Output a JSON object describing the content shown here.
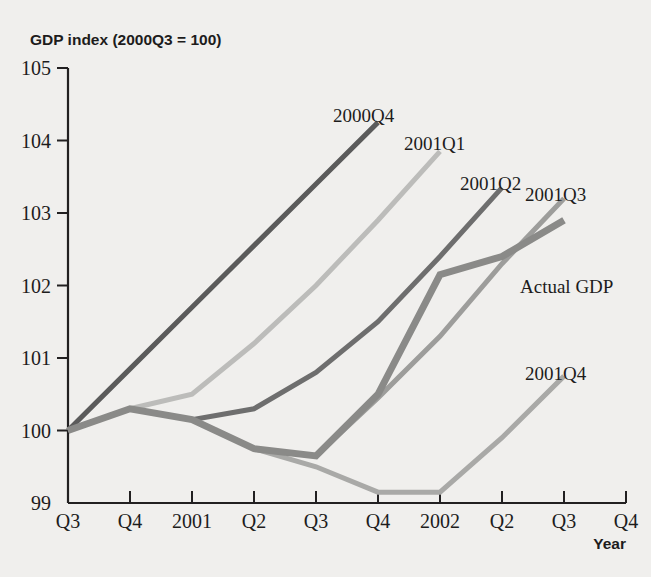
{
  "chart_data": {
    "type": "line",
    "title": "GDP index (2000Q3 = 100)",
    "ylabel": "GDP index (2000Q3 = 100)",
    "xlabel": "Year",
    "ylim": [
      99,
      105
    ],
    "ytick_labels": [
      "105",
      "104",
      "103",
      "102",
      "101",
      "100",
      "99"
    ],
    "ytick_values": [
      105,
      104,
      103,
      102,
      101,
      100,
      99
    ],
    "xtick_labels": [
      "Q3",
      "Q4",
      "2001",
      "Q2",
      "Q3",
      "Q4",
      "2002",
      "Q2",
      "Q3",
      "Q4"
    ],
    "x_index": [
      0,
      1,
      2,
      3,
      4,
      5,
      6,
      7,
      8,
      9
    ],
    "grid": false,
    "legend": "inline-labels",
    "series": [
      {
        "name": "2000Q4",
        "label": "2000Q4",
        "color": "#5b5b5b",
        "width": 5.0,
        "x": [
          0,
          1,
          2,
          3,
          4,
          5
        ],
        "values": [
          100.0,
          100.85,
          101.7,
          102.55,
          103.4,
          104.25
        ]
      },
      {
        "name": "2001Q1",
        "label": "2001Q1",
        "color": "#bcbcba",
        "width": 5.0,
        "x": [
          0,
          1,
          2,
          3,
          4,
          5,
          6
        ],
        "values": [
          100.0,
          100.3,
          100.5,
          101.2,
          102.0,
          102.9,
          103.85
        ]
      },
      {
        "name": "2001Q2",
        "label": "2001Q2",
        "color": "#6e6e6e",
        "width": 5.0,
        "x": [
          1,
          2,
          3,
          4,
          5,
          6,
          7
        ],
        "values": [
          100.3,
          100.15,
          100.3,
          100.8,
          101.5,
          102.4,
          103.35
        ]
      },
      {
        "name": "2001Q3",
        "label": "2001Q3",
        "color": "#9d9d9b",
        "width": 5.0,
        "x": [
          2,
          3,
          4,
          5,
          6,
          7,
          8
        ],
        "values": [
          100.15,
          99.75,
          99.65,
          100.45,
          101.3,
          102.3,
          103.2
        ]
      },
      {
        "name": "2001Q4",
        "label": "2001Q4",
        "color": "#a9a9a7",
        "width": 5.0,
        "x": [
          3,
          4,
          5,
          6,
          7,
          8
        ],
        "values": [
          99.75,
          99.5,
          99.15,
          99.15,
          99.9,
          100.75
        ]
      },
      {
        "name": "Actual GDP",
        "label": "Actual GDP",
        "color": "#8a8a88",
        "width": 7.0,
        "x": [
          0,
          1,
          2,
          3,
          4,
          5,
          6,
          7,
          8
        ],
        "values": [
          100.0,
          100.3,
          100.15,
          99.75,
          99.65,
          100.5,
          102.15,
          102.4,
          102.9
        ]
      }
    ],
    "series_labels": [
      {
        "text": "2000Q4",
        "x": 333,
        "y": 122,
        "name": "series-label-2000q4"
      },
      {
        "text": "2001Q1",
        "x": 404,
        "y": 150,
        "name": "series-label-2001q1"
      },
      {
        "text": "2001Q2",
        "x": 460,
        "y": 190,
        "name": "series-label-2001q2"
      },
      {
        "text": "2001Q3",
        "x": 525,
        "y": 201,
        "name": "series-label-2001q3"
      },
      {
        "text": "Actual GDP",
        "x": 520,
        "y": 293,
        "name": "series-label-actual-gdp"
      },
      {
        "text": "2001Q4",
        "x": 525,
        "y": 380,
        "name": "series-label-2001q4"
      }
    ]
  },
  "axes": {
    "y_title": "GDP index (2000Q3 = 100)",
    "x_title": "Year"
  },
  "colors": {
    "background": "#f0efed",
    "axis": "#222021",
    "text": "#1d1c1c"
  }
}
